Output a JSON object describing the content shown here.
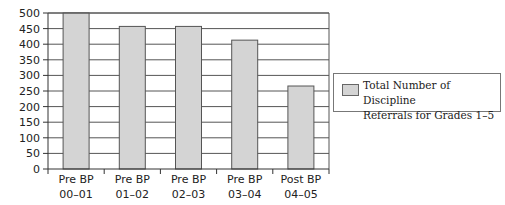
{
  "chart_data": {
    "type": "bar",
    "title": "",
    "xlabel": "",
    "ylabel": "",
    "categories": [
      [
        "Pre BP",
        "00-01"
      ],
      [
        "Pre BP",
        "01-02"
      ],
      [
        "Pre BP",
        "02-03"
      ],
      [
        "Pre BP",
        "03-04"
      ],
      [
        "Post BP",
        "04-05"
      ]
    ],
    "series": [
      {
        "name": "Total Number of Discipline Referrals for Grades 1-5",
        "values": [
          500,
          457,
          457,
          413,
          266
        ],
        "color": "#d4d4d4"
      }
    ],
    "ylim": [
      0,
      500
    ],
    "yticks": [
      0,
      50,
      100,
      150,
      200,
      250,
      300,
      350,
      400,
      450,
      500
    ],
    "grid": true,
    "legend_position": "right"
  },
  "legend": {
    "line1": "Total Number of Discipline",
    "line2": "Referrals for Grades 1–5"
  }
}
